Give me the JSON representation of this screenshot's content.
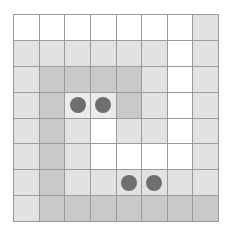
{
  "board": {
    "rows": 8,
    "cols": 8,
    "colors": {
      "W": "#ffffff",
      "L": "#e2e2e2",
      "M": "#c9c9c9",
      "P": "#ebebeb",
      "dot": "#6f6f6f",
      "grid": "#9a9a9a"
    },
    "cells": [
      [
        "W",
        "W",
        "W",
        "W",
        "W",
        "W",
        "W",
        "L"
      ],
      [
        "L",
        "L",
        "L",
        "L",
        "L",
        "L",
        "W",
        "L"
      ],
      [
        "L",
        "M",
        "M",
        "M",
        "M",
        "L",
        "W",
        "L"
      ],
      [
        "L",
        "M",
        "P",
        "P",
        "M",
        "L",
        "W",
        "L"
      ],
      [
        "L",
        "M",
        "L",
        "W",
        "L",
        "L",
        "W",
        "L"
      ],
      [
        "L",
        "M",
        "L",
        "W",
        "W",
        "W",
        "W",
        "L"
      ],
      [
        "L",
        "M",
        "L",
        "L",
        "L",
        "L",
        "L",
        "L"
      ],
      [
        "L",
        "M",
        "M",
        "M",
        "M",
        "M",
        "M",
        "M"
      ]
    ],
    "pieces": [
      {
        "row": 3,
        "col": 2
      },
      {
        "row": 3,
        "col": 3
      },
      {
        "row": 6,
        "col": 4
      },
      {
        "row": 6,
        "col": 5
      }
    ]
  }
}
